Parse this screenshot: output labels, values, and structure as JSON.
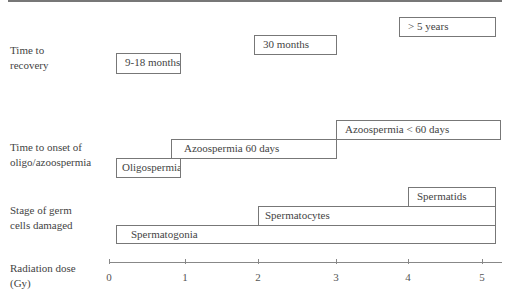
{
  "diagram": {
    "rows": [
      {
        "label_line1": "Time to",
        "label_line2": "recovery"
      },
      {
        "label_line1": "Time to onset of",
        "label_line2": "oligo/azoospermia"
      },
      {
        "label_line1": "Stage of germ",
        "label_line2": "cells damaged"
      }
    ],
    "axis": {
      "label_line1": "Radiation dose",
      "label_line2": "(Gy)",
      "ticks": [
        "0",
        "1",
        "2",
        "3",
        "4",
        "5"
      ]
    },
    "recovery": {
      "box1": "9-18 months",
      "box2": "30 months",
      "box3": "> 5 years"
    },
    "onset": {
      "box1": "Oligospermia",
      "box2": "Azoospermia 60 days",
      "box3": "Azoospermia < 60 days"
    },
    "germ": {
      "box1": "Spermatogonia",
      "box2": "Spermatocytes",
      "box3": "Spermatids"
    },
    "colors": {
      "line": "#777777",
      "text": "#444444",
      "background": "#ffffff"
    }
  }
}
